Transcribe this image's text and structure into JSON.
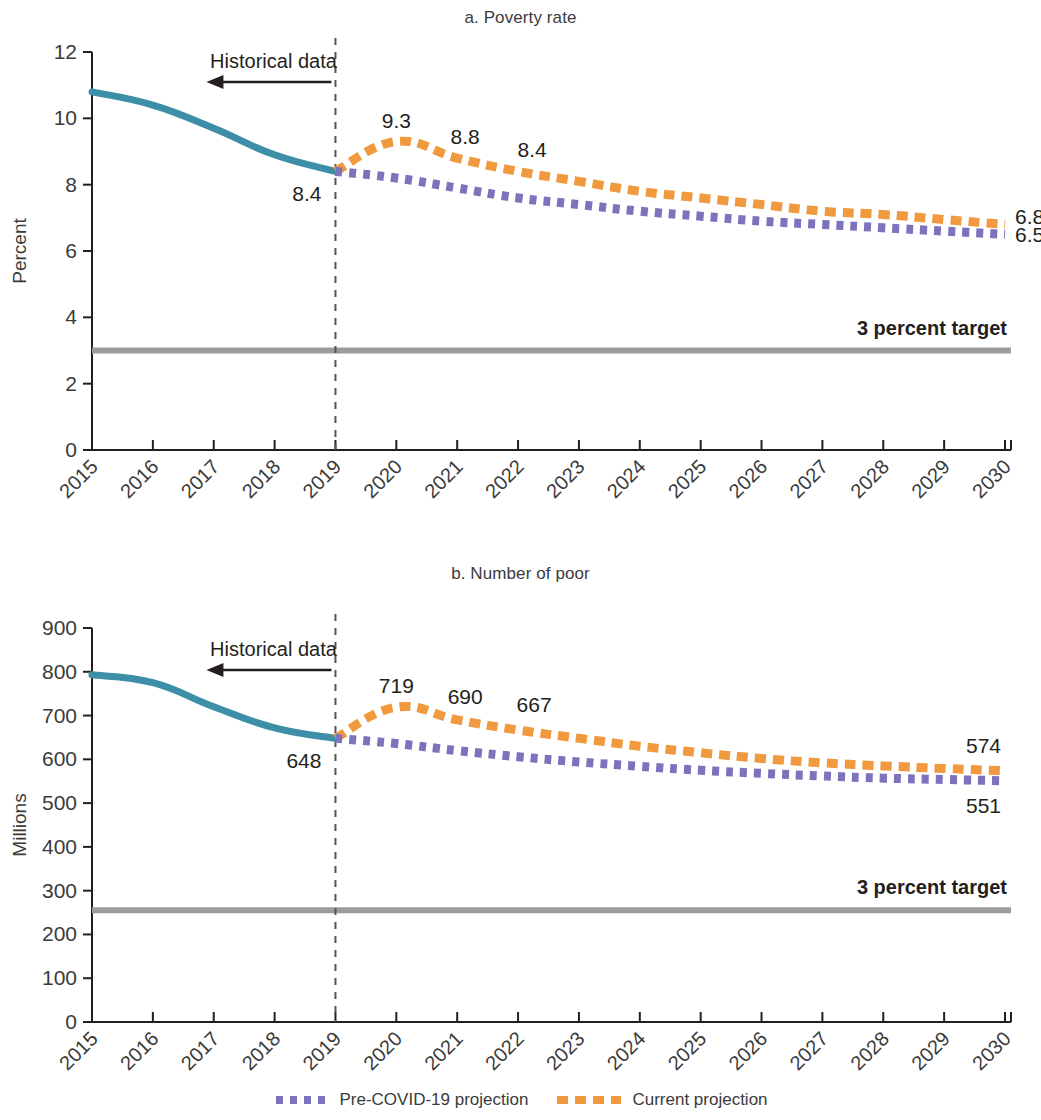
{
  "legend": {
    "items": [
      {
        "label": "Pre-COVID-19 projection",
        "color": "#7b74bd",
        "style": "dotted"
      },
      {
        "label": "Current projection",
        "color": "#f0993e",
        "style": "dashed"
      }
    ]
  },
  "colors": {
    "historical": "#3d8fa8",
    "pre_covid": "#7b74bd",
    "current": "#f0993e",
    "target": "#9b9b9b",
    "axis": "#231f20",
    "text": "#3b3b3b",
    "divider": "#555555"
  },
  "annotations": {
    "historical_label": "Historical data",
    "target_label": "3 percent target"
  },
  "chart_data": [
    {
      "type": "line",
      "title": "a. Poverty rate",
      "xlabel": "",
      "ylabel": "Percent",
      "ylim": [
        0,
        12
      ],
      "yticks": [
        0,
        2,
        4,
        6,
        8,
        10,
        12
      ],
      "xlim": [
        2015,
        2030
      ],
      "xticks": [
        2015,
        2016,
        2017,
        2018,
        2019,
        2020,
        2021,
        2022,
        2023,
        2024,
        2025,
        2026,
        2027,
        2028,
        2029,
        2030
      ],
      "grid": false,
      "legend_position": "bottom",
      "divider_year": 2019,
      "target_value": 3.0,
      "target_label": "3 percent target",
      "series": [
        {
          "name": "Historical data",
          "color": "#3d8fa8",
          "style": "solid",
          "x": [
            2015,
            2016,
            2017,
            2018,
            2019
          ],
          "values": [
            10.8,
            10.4,
            9.7,
            8.9,
            8.4
          ]
        },
        {
          "name": "Current projection",
          "color": "#f0993e",
          "style": "dashed",
          "x": [
            2019,
            2020,
            2021,
            2022,
            2023,
            2024,
            2025,
            2026,
            2027,
            2028,
            2029,
            2030
          ],
          "values": [
            8.4,
            9.3,
            8.8,
            8.4,
            8.1,
            7.8,
            7.6,
            7.4,
            7.2,
            7.1,
            6.95,
            6.8
          ]
        },
        {
          "name": "Pre-COVID-19 projection",
          "color": "#7b74bd",
          "style": "dotted",
          "x": [
            2019,
            2020,
            2021,
            2022,
            2023,
            2024,
            2025,
            2026,
            2027,
            2028,
            2029,
            2030
          ],
          "values": [
            8.4,
            8.2,
            7.9,
            7.6,
            7.4,
            7.2,
            7.05,
            6.9,
            6.8,
            6.7,
            6.6,
            6.5
          ]
        }
      ],
      "point_labels": [
        {
          "text": "8.4",
          "year": 2019,
          "value": 8.4,
          "dx": -14,
          "dy": 30,
          "anchor": "end"
        },
        {
          "text": "9.3",
          "year": 2020,
          "value": 9.3,
          "dx": 0,
          "dy": -14,
          "anchor": "middle"
        },
        {
          "text": "8.8",
          "year": 2021,
          "value": 8.8,
          "dx": 8,
          "dy": -14,
          "anchor": "middle"
        },
        {
          "text": "8.4",
          "year": 2022,
          "value": 8.4,
          "dx": 14,
          "dy": -14,
          "anchor": "middle"
        },
        {
          "text": "6.8",
          "year": 2030,
          "value": 6.8,
          "dx": 10,
          "dy": 0,
          "anchor": "start"
        },
        {
          "text": "6.5",
          "year": 2030,
          "value": 6.5,
          "dx": 10,
          "dy": 8,
          "anchor": "start"
        }
      ]
    },
    {
      "type": "line",
      "title": "b. Number of poor",
      "xlabel": "",
      "ylabel": "Millions",
      "ylim": [
        0,
        900
      ],
      "yticks": [
        0,
        100,
        200,
        300,
        400,
        500,
        600,
        700,
        800,
        900
      ],
      "xlim": [
        2015,
        2030
      ],
      "xticks": [
        2015,
        2016,
        2017,
        2018,
        2019,
        2020,
        2021,
        2022,
        2023,
        2024,
        2025,
        2026,
        2027,
        2028,
        2029,
        2030
      ],
      "grid": false,
      "legend_position": "bottom",
      "divider_year": 2019,
      "target_value": 255,
      "target_label": "3 percent target",
      "series": [
        {
          "name": "Historical data",
          "color": "#3d8fa8",
          "style": "solid",
          "x": [
            2015,
            2016,
            2017,
            2018,
            2019
          ],
          "values": [
            793,
            775,
            720,
            672,
            648
          ]
        },
        {
          "name": "Current projection",
          "color": "#f0993e",
          "style": "dashed",
          "x": [
            2019,
            2020,
            2021,
            2022,
            2023,
            2024,
            2025,
            2026,
            2027,
            2028,
            2029,
            2030
          ],
          "values": [
            648,
            719,
            690,
            667,
            648,
            630,
            615,
            602,
            592,
            585,
            579,
            574
          ]
        },
        {
          "name": "Pre-COVID-19 projection",
          "color": "#7b74bd",
          "style": "dotted",
          "x": [
            2019,
            2020,
            2021,
            2022,
            2023,
            2024,
            2025,
            2026,
            2027,
            2028,
            2029,
            2030
          ],
          "values": [
            648,
            636,
            620,
            606,
            594,
            584,
            575,
            568,
            562,
            557,
            554,
            551
          ]
        }
      ],
      "point_labels": [
        {
          "text": "648",
          "year": 2019,
          "value": 648,
          "dx": -14,
          "dy": 30,
          "anchor": "end"
        },
        {
          "text": "719",
          "year": 2020,
          "value": 719,
          "dx": 0,
          "dy": -14,
          "anchor": "middle"
        },
        {
          "text": "690",
          "year": 2021,
          "value": 690,
          "dx": 8,
          "dy": -16,
          "anchor": "middle"
        },
        {
          "text": "667",
          "year": 2022,
          "value": 667,
          "dx": 16,
          "dy": -18,
          "anchor": "middle"
        },
        {
          "text": "574",
          "year": 2030,
          "value": 574,
          "dx": -4,
          "dy": -18,
          "anchor": "end"
        },
        {
          "text": "551",
          "year": 2030,
          "value": 551,
          "dx": -4,
          "dy": 32,
          "anchor": "end"
        }
      ]
    }
  ]
}
